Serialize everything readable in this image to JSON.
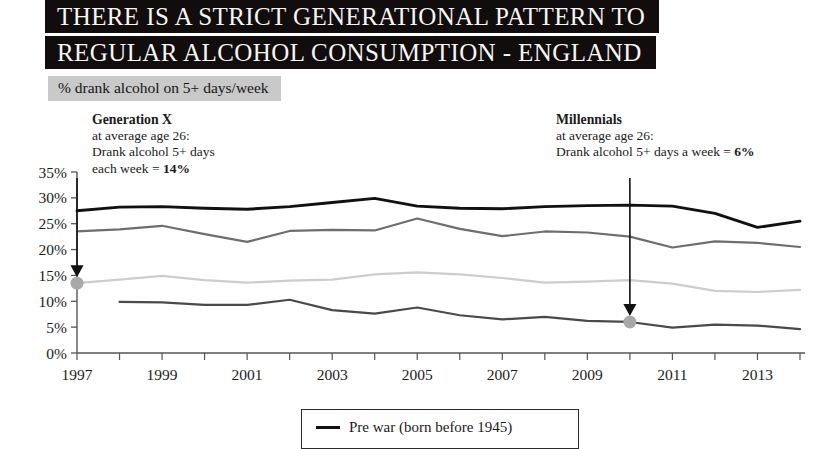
{
  "title": {
    "line1": "THERE IS A STRICT GENERATIONAL PATTERN TO",
    "line2": "REGULAR ALCOHOL CONSUMPTION - ENGLAND"
  },
  "subtitle": "% drank alcohol on 5+ days/week",
  "annotations": {
    "generation_x": {
      "heading": "Generation X",
      "line1": "at average age 26:",
      "line2": "Drank alcohol 5+ days",
      "line3_prefix": "each week = ",
      "line3_value": "14%",
      "point_year": 1997,
      "point_value": 13.5
    },
    "millennials": {
      "heading": "Millennials",
      "line1": "at average age 26:",
      "line2_prefix": "Drank alcohol 5+ days a week = ",
      "line2_value": "6%",
      "point_year": 2010,
      "point_value": 6
    }
  },
  "legend": {
    "items": [
      {
        "label": "Pre war (born before 1945)",
        "color": "#111111"
      }
    ]
  },
  "colors": {
    "pre_war": "#111111",
    "boomers": "#6e6e6e",
    "generation_x": "#cdcdcd",
    "millennials": "#4a4a4a",
    "title_bar_bg": "#100d0c",
    "title_bar_text": "#f7f5f2",
    "subtitle_bg": "#c9c9c9",
    "axis": "#555555",
    "annotation_dot": "#a8a8a8"
  },
  "chart_data": {
    "type": "line",
    "title": "THERE IS A STRICT GENERATIONAL PATTERN TO REGULAR ALCOHOL CONSUMPTION - ENGLAND",
    "subtitle": "% drank alcohol on 5+ days/week",
    "xlabel": "",
    "ylabel": "% drank alcohol on 5+ days/week",
    "x": [
      1997,
      1998,
      1999,
      2000,
      2001,
      2002,
      2003,
      2004,
      2005,
      2006,
      2007,
      2008,
      2009,
      2010,
      2011,
      2012,
      2013,
      2014
    ],
    "xtick_labels": [
      "1997",
      "",
      "1999",
      "",
      "2001",
      "",
      "2003",
      "",
      "2005",
      "",
      "2007",
      "",
      "2009",
      "",
      "2011",
      "",
      "2013",
      ""
    ],
    "ylim": [
      0,
      35
    ],
    "ytick_values": [
      0,
      5,
      10,
      15,
      20,
      25,
      30,
      35
    ],
    "ytick_labels": [
      "0%",
      "5%",
      "10%",
      "15%",
      "20%",
      "25%",
      "30%",
      "35%"
    ],
    "grid": false,
    "legend_position": "bottom",
    "series": [
      {
        "name": "Pre war (born before 1945)",
        "color": "#111111",
        "values": [
          27.5,
          28.2,
          28.3,
          28.0,
          27.8,
          28.3,
          29.1,
          29.9,
          28.4,
          28.0,
          27.9,
          28.3,
          28.5,
          28.6,
          28.4,
          27.0,
          24.3,
          25.5
        ]
      },
      {
        "name": "Boomers",
        "color": "#6e6e6e",
        "values": [
          23.5,
          23.9,
          24.6,
          23.0,
          21.5,
          23.6,
          23.8,
          23.7,
          26.0,
          24.0,
          22.6,
          23.5,
          23.3,
          22.5,
          20.4,
          21.6,
          21.3,
          20.5
        ]
      },
      {
        "name": "Generation X",
        "color": "#cdcdcd",
        "values": [
          13.5,
          14.2,
          14.9,
          14.1,
          13.6,
          14.0,
          14.2,
          15.2,
          15.6,
          15.2,
          14.5,
          13.6,
          13.8,
          14.1,
          13.4,
          12.0,
          11.8,
          12.2
        ]
      },
      {
        "name": "Millennials",
        "color": "#4a4a4a",
        "values": [
          null,
          9.9,
          9.8,
          9.3,
          9.3,
          10.3,
          8.3,
          7.6,
          8.8,
          7.3,
          6.5,
          7.0,
          6.2,
          6.0,
          4.9,
          5.5,
          5.3,
          4.6
        ]
      }
    ]
  }
}
